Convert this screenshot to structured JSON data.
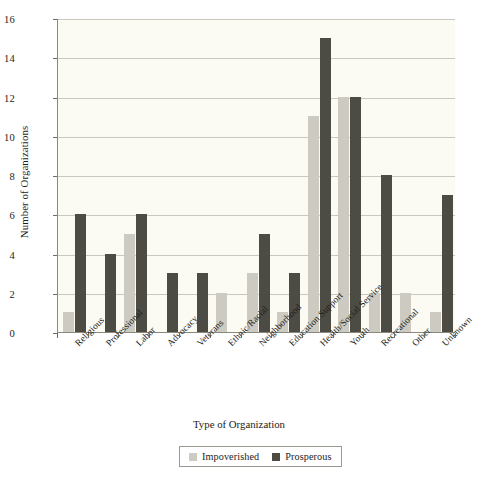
{
  "chart_data": {
    "type": "bar",
    "title": "",
    "xlabel": "Type of Organization",
    "ylabel": "Number of Organizations",
    "categories": [
      "Religious",
      "Professional",
      "Labor",
      "Advocacy",
      "Veterans",
      "Ethnic/Racial",
      "Neighborhood",
      "Education Support",
      "Health/Social Service",
      "Youth",
      "Recreational",
      "Other",
      "Unknown"
    ],
    "series": [
      {
        "name": "Impoverished",
        "color": "#cdcbc1",
        "values": [
          1,
          0,
          5,
          0,
          0,
          2,
          3,
          1,
          11,
          12,
          2,
          2,
          1
        ]
      },
      {
        "name": "Prosperous",
        "color": "#4d4c44",
        "values": [
          6,
          4,
          6,
          3,
          3,
          0,
          5,
          3,
          15,
          12,
          8,
          0,
          7
        ]
      }
    ],
    "ylim": [
      0,
      16
    ],
    "yticks": [
      0,
      2,
      4,
      6,
      8,
      10,
      12,
      14,
      16
    ],
    "ytick_labels": [
      "0",
      "2",
      "4",
      "6",
      "8",
      "10",
      "12",
      "14",
      "16"
    ],
    "grid": true,
    "legend_position": "bottom-center",
    "plot_background": "#fbfaf3",
    "gridline_color": "#c9c8bd",
    "axis_color": "#8b897e"
  }
}
